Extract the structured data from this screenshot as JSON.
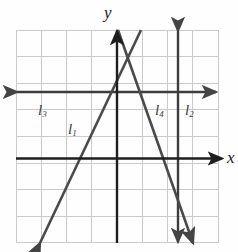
{
  "figure": {
    "kind": "coordinate-grid-line-graph",
    "background": "#fefefe",
    "grid": {
      "color": "#c9c9ce",
      "left": 16,
      "top": 30,
      "right": 218,
      "bottom": 243,
      "columns": 8,
      "rows": 8,
      "cell_width": 25.25,
      "cell_height": 26.6,
      "visible": true
    },
    "axes": {
      "color": "#1e1e1e",
      "x_axis": {
        "label": "x",
        "y": 158.5,
        "x_start": 16,
        "x_end": 222,
        "arrow": "right"
      },
      "y_axis": {
        "label": "y",
        "x": 117,
        "y_start": 31,
        "y_end": 243,
        "arrow": "up"
      }
    },
    "lines": [
      {
        "name": "l1",
        "label": "l",
        "subscript": "1",
        "color": "#4a4a4a",
        "x1": 40,
        "y1": 243,
        "x2": 141,
        "y2": 30,
        "arrow_start": true,
        "arrow_end": false,
        "label_x": 68,
        "label_y": 122
      },
      {
        "name": "l2",
        "label": "l",
        "subscript": "2",
        "color": "#3d3d3d",
        "x1": 178,
        "y1": 31,
        "x2": 178,
        "y2": 242,
        "arrow_start": true,
        "arrow_end": true,
        "label_x": 185,
        "label_y": 103
      },
      {
        "name": "l3",
        "label": "l",
        "subscript": "3",
        "color": "#3d3d3d",
        "x1": 17,
        "y1": 92,
        "x2": 216,
        "y2": 92,
        "arrow_start": true,
        "arrow_end": true,
        "label_x": 38,
        "label_y": 103
      },
      {
        "name": "l4",
        "label": "l",
        "subscript": "4",
        "color": "#4a4a4a",
        "x1": 118,
        "y1": 30,
        "x2": 193,
        "y2": 243,
        "arrow_start": false,
        "arrow_end": true,
        "label_x": 155,
        "label_y": 103
      }
    ]
  }
}
